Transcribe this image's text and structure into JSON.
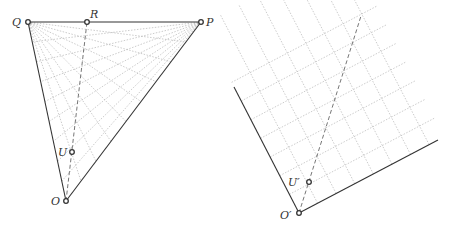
{
  "left_diagram": {
    "points": {
      "Q": {
        "label": "Q",
        "x": 28,
        "y": 22,
        "lx": 12,
        "ly": 26
      },
      "R": {
        "label": "R",
        "x": 87,
        "y": 22,
        "lx": 90,
        "ly": 18
      },
      "P": {
        "label": "P",
        "x": 201,
        "y": 22,
        "lx": 206,
        "ly": 26
      },
      "U": {
        "label": "U",
        "x": 72,
        "y": 152,
        "lx": 58,
        "ly": 156
      },
      "O": {
        "label": "O",
        "x": 66,
        "y": 201,
        "lx": 51,
        "ly": 205
      }
    },
    "fan_count": 8
  },
  "right_diagram": {
    "points": {
      "O2": {
        "label": "O′",
        "x": 299,
        "y": 213,
        "lx": 280,
        "ly": 219
      },
      "U2": {
        "label": "U′",
        "x": 309,
        "y": 182,
        "lx": 288,
        "ly": 186
      }
    },
    "edge_a_end": {
      "x": 234,
      "y": 87
    },
    "edge_b_end": {
      "x": 438,
      "y": 140
    },
    "grid_count": 7,
    "dashed_end": {
      "x": 361,
      "y": 16
    }
  },
  "colors": {
    "edge": "#333333",
    "grid": "#aaaaaa",
    "dashed": "#666666",
    "point": "#333333"
  }
}
